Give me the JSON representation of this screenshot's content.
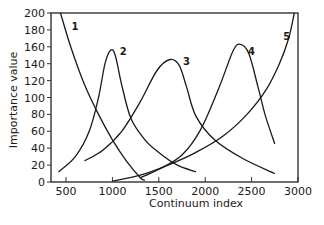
{
  "chart_data": {
    "type": "line",
    "title": "",
    "xlabel": "Continuum index",
    "ylabel": "Importance value",
    "xlim": [
      338,
      3000
    ],
    "ylim": [
      0,
      200
    ],
    "grid": false,
    "legend": "none (curves labelled inline)",
    "xticks": [
      500,
      1000,
      1500,
      2000,
      2500,
      3000
    ],
    "yticks": [
      0,
      20,
      40,
      60,
      80,
      100,
      120,
      140,
      160,
      180,
      200
    ],
    "series": [
      {
        "name": "1",
        "label_at": [
          560,
          180
        ],
        "points": [
          [
            440,
            200
          ],
          [
            550,
            160
          ],
          [
            700,
            115
          ],
          [
            850,
            80
          ],
          [
            1000,
            50
          ],
          [
            1150,
            25
          ],
          [
            1300,
            5
          ],
          [
            1350,
            2
          ]
        ]
      },
      {
        "name": "2",
        "label_at": [
          1080,
          150
        ],
        "points": [
          [
            420,
            12
          ],
          [
            600,
            30
          ],
          [
            750,
            60
          ],
          [
            850,
            100
          ],
          [
            920,
            140
          ],
          [
            980,
            156
          ],
          [
            1030,
            150
          ],
          [
            1100,
            115
          ],
          [
            1200,
            75
          ],
          [
            1350,
            50
          ],
          [
            1500,
            35
          ],
          [
            1700,
            20
          ],
          [
            1900,
            12
          ]
        ]
      },
      {
        "name": "3",
        "label_at": [
          1760,
          138
        ],
        "points": [
          [
            700,
            25
          ],
          [
            900,
            38
          ],
          [
            1100,
            60
          ],
          [
            1300,
            95
          ],
          [
            1480,
            132
          ],
          [
            1620,
            145
          ],
          [
            1720,
            138
          ],
          [
            1800,
            112
          ],
          [
            1900,
            78
          ],
          [
            2100,
            50
          ],
          [
            2400,
            28
          ],
          [
            2750,
            10
          ]
        ]
      },
      {
        "name": "4",
        "label_at": [
          2460,
          150
        ],
        "points": [
          [
            1300,
            5
          ],
          [
            1500,
            15
          ],
          [
            1750,
            32
          ],
          [
            1950,
            62
          ],
          [
            2150,
            112
          ],
          [
            2300,
            155
          ],
          [
            2380,
            163
          ],
          [
            2470,
            152
          ],
          [
            2570,
            112
          ],
          [
            2650,
            78
          ],
          [
            2750,
            45
          ]
        ]
      },
      {
        "name": "5",
        "label_at": [
          2840,
          168
        ],
        "points": [
          [
            1000,
            1
          ],
          [
            1300,
            8
          ],
          [
            1600,
            20
          ],
          [
            1900,
            35
          ],
          [
            2200,
            55
          ],
          [
            2450,
            80
          ],
          [
            2650,
            108
          ],
          [
            2800,
            140
          ],
          [
            2900,
            170
          ],
          [
            2960,
            200
          ]
        ]
      }
    ]
  }
}
